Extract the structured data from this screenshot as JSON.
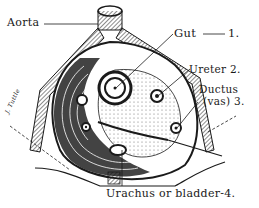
{
  "figure": {
    "type": "anatomical cross-section illustration",
    "labels": {
      "aorta": "Aorta",
      "gut": "Gut",
      "gut_num": "1.",
      "ureter": "Ureter 2.",
      "ductus_line1": "Ductus",
      "ductus_line2": "(vas) 3.",
      "urachus": "Urachus or bladder-4.",
      "signature": "J. Tuttle"
    },
    "colors": {
      "ink": "#1a1a1a",
      "background": "#ffffff",
      "stipple": "#555555"
    }
  }
}
